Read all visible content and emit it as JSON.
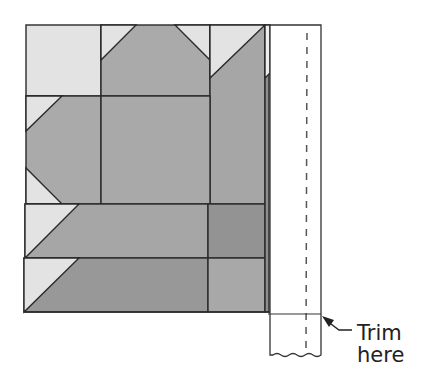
{
  "figure": {
    "type": "quilt-block-trimming-diagram",
    "annotation": {
      "line1": "Trim",
      "line2": "here"
    },
    "colors": {
      "light_fabric": "#e3e3e3",
      "medium_fabric": "#aaaaaa",
      "dark_fabric": "#989898",
      "darker_fabric": "#929292",
      "strip_fill": "#ffffff",
      "outline": "#2a2a2a",
      "dash_line": "#555555"
    },
    "parts": {
      "block": "quilt-block",
      "strip": "border-strip",
      "dashed": "seam-guide-line",
      "trim_line": "trim-line",
      "arrow": "pointer-arrow"
    }
  }
}
